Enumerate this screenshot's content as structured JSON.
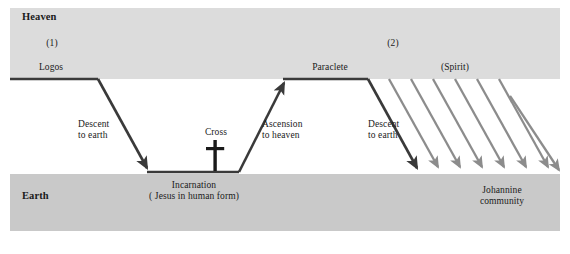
{
  "figure": {
    "type": "diagram"
  },
  "bands": {
    "heaven": {
      "label": "Heaven",
      "fill": "#dcdcdc"
    },
    "earth": {
      "label": "Earth",
      "fill": "#c9c9c9"
    }
  },
  "phases": {
    "one": "(1)",
    "two": "(2)"
  },
  "nodes": {
    "logos": "Logos",
    "paraclete": "Paraclete",
    "spirit": "(Spirit)",
    "incarnation_title": "Incarnation",
    "incarnation_gloss": "( Jesus in human form)",
    "johannine_line1": "Johannine",
    "johannine_line2": "community"
  },
  "motions": {
    "descent1_line1": "Descent",
    "descent1_line2": "to earth",
    "cross": "Cross",
    "ascension_line1": "Ascension",
    "ascension_line2": "to heaven",
    "descent2_line1": "Descent",
    "descent2_line2": "to earth"
  },
  "colors": {
    "path_stroke": "#3a3a3a",
    "spirit_arrow": "#8c8c8c",
    "text": "#1a1a1a",
    "page_background": "#ffffff"
  },
  "geometry": {
    "heaven_top": 8,
    "heaven_bottom": 79,
    "earth_top": 174,
    "earth_bottom": 231,
    "left_margin": 10,
    "right_margin": 560
  },
  "spirit_arrow_count": 7
}
